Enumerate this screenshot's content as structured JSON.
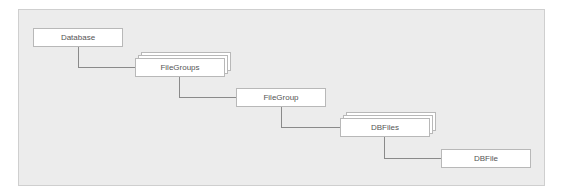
{
  "diagram": {
    "nodes": [
      {
        "id": "database",
        "label": "Database",
        "collection": false
      },
      {
        "id": "filegroups",
        "label": "FileGroups",
        "collection": true
      },
      {
        "id": "filegroup",
        "label": "FileGroup",
        "collection": false
      },
      {
        "id": "dbfiles",
        "label": "DBFiles",
        "collection": true
      },
      {
        "id": "dbfile",
        "label": "DBFile",
        "collection": false
      }
    ],
    "edges": [
      {
        "from": "database",
        "to": "filegroups"
      },
      {
        "from": "filegroups",
        "to": "filegroup"
      },
      {
        "from": "filegroup",
        "to": "dbfiles"
      },
      {
        "from": "dbfiles",
        "to": "dbfile"
      }
    ]
  }
}
